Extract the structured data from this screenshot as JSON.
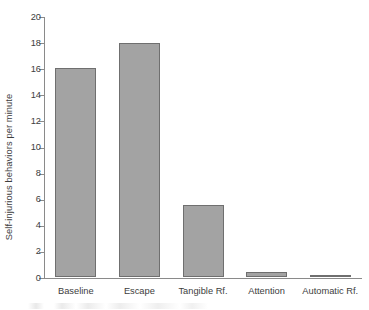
{
  "chart_data": {
    "type": "bar",
    "title": "",
    "subtitle": "",
    "xlabel": "",
    "ylabel": "Self-injurious behaviors per minute",
    "categories": [
      "Baseline",
      "Escape",
      "Tangible Rf.",
      "Attention",
      "Automatic Rf."
    ],
    "values": [
      16.0,
      17.9,
      5.5,
      0.35,
      0.15
    ],
    "series": [
      {
        "name": "Self-injurious behaviors per minute",
        "values": [
          16.0,
          17.9,
          5.5,
          0.35,
          0.15
        ]
      }
    ],
    "ylim": [
      0,
      20
    ],
    "ytick_values": [
      0,
      2,
      4,
      6,
      8,
      10,
      12,
      14,
      16,
      18,
      20
    ],
    "ytick_labels": [
      "0",
      "2",
      "4",
      "6",
      "8",
      "10",
      "12",
      "14",
      "16",
      "18",
      "20"
    ],
    "ytick_interval": 2,
    "grid": false,
    "legend": false,
    "legend_position": "none",
    "annotations": [],
    "colors": {
      "bar_fill": "#a3a3a3",
      "bar_edge": "#6f6f6f",
      "axis": "#8a8a8a",
      "text": "#3d3d3d",
      "background": "#ffffff"
    }
  }
}
